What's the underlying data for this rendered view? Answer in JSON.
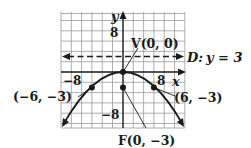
{
  "figure": {
    "type": "parabola-graph",
    "equation_form": "x^2 = -12y",
    "axes": {
      "x_label": "x",
      "y_label": "y",
      "x_tick_labels": [
        "-8",
        "8"
      ],
      "y_tick_labels": [
        "8",
        "-8"
      ],
      "x_range": [
        -12,
        12
      ],
      "y_range": [
        -10.5,
        12
      ],
      "grid_step": 2
    },
    "vertex": {
      "label": "V(0, 0)",
      "x": 0,
      "y": 0
    },
    "focus": {
      "label": "F(0, −3)",
      "x": 0,
      "y": -3
    },
    "directrix": {
      "label": "D: y = 3",
      "y": 3,
      "style": "dashed"
    },
    "points": [
      {
        "label": "(−6, −3)",
        "x": -6,
        "y": -3
      },
      {
        "label": "(6, −3)",
        "x": 6,
        "y": -3
      }
    ],
    "colors": {
      "ink": "#1a1a1a",
      "grid": "#9a9a9a"
    }
  },
  "labels": {
    "x_axis": "x",
    "y_axis": "y",
    "tick_x_neg": "−8",
    "tick_x_pos": "8",
    "tick_y_pos": "8",
    "tick_y_neg": "−8",
    "vertex": "V(0, 0)",
    "focus": "F(0, −3)",
    "directrix_D": "D:",
    "directrix_eq": "y = 3",
    "point_left": "(−6, −3)",
    "point_right": "(6, −3)"
  }
}
